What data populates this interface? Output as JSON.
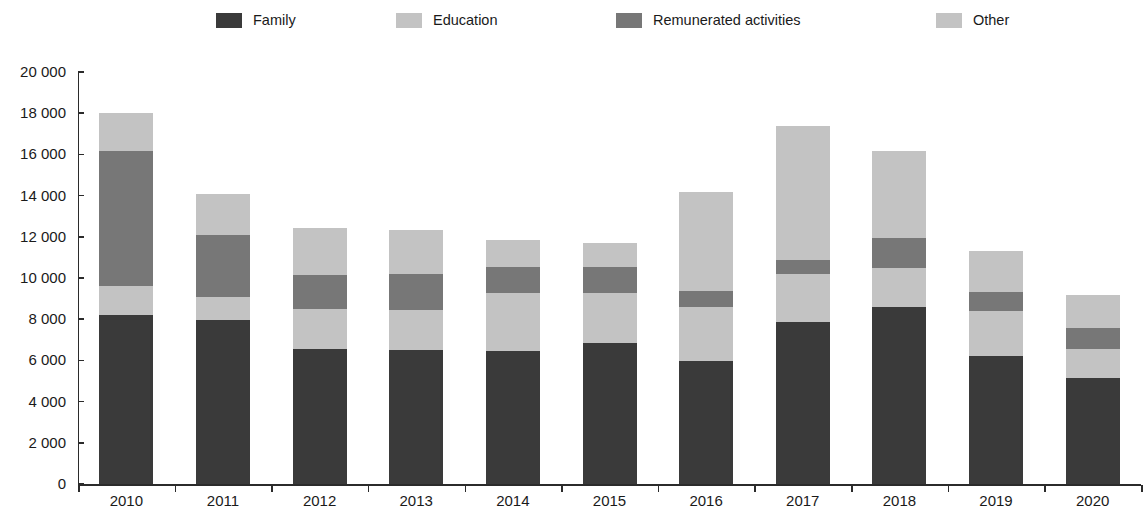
{
  "legend": {
    "items": [
      {
        "label": "Family",
        "color": "#3a3a3a",
        "x": 216
      },
      {
        "label": "Education",
        "color": "#c3c3c3",
        "x": 396
      },
      {
        "label": "Remunerated activities",
        "color": "#777777",
        "x": 616
      },
      {
        "label": "Other",
        "color": "#c3c3c3",
        "x": 936
      }
    ]
  },
  "axes": {
    "y_ticks": [
      "20 000",
      "18 000",
      "16 000",
      "14 000",
      "12 000",
      "10 000",
      "8 000",
      "6 000",
      "4 000",
      "2 000",
      "0"
    ],
    "y_tick_values": [
      20000,
      18000,
      16000,
      14000,
      12000,
      10000,
      8000,
      6000,
      4000,
      2000,
      0
    ],
    "y_min": 0,
    "y_max": 20000,
    "x_ticks": [
      "2010",
      "2011",
      "2012",
      "2013",
      "2014",
      "2015",
      "2016",
      "2017",
      "2018",
      "2019",
      "2020"
    ]
  },
  "chart_data": {
    "type": "bar",
    "stacked": true,
    "title": "",
    "subtitle": "",
    "xlabel": "",
    "ylabel": "",
    "ylim": [
      0,
      20000
    ],
    "grid": false,
    "legend_position": "top",
    "categories": [
      "2010",
      "2011",
      "2012",
      "2013",
      "2014",
      "2015",
      "2016",
      "2017",
      "2018",
      "2019",
      "2020"
    ],
    "series": [
      {
        "name": "Family",
        "color": "#3a3a3a",
        "values": [
          8200,
          7980,
          6530,
          6490,
          6450,
          6840,
          5980,
          7880,
          8600,
          6200,
          5150
        ]
      },
      {
        "name": "Education",
        "color": "#c3c3c3",
        "values": [
          1400,
          1120,
          1950,
          1980,
          2820,
          2430,
          2600,
          2300,
          1870,
          2180,
          1400
        ]
      },
      {
        "name": "Remunerated activities",
        "color": "#777777",
        "values": [
          6550,
          2980,
          1670,
          1740,
          1250,
          1260,
          790,
          700,
          1450,
          940,
          1040
        ]
      },
      {
        "name": "Other",
        "color": "#c3c3c3",
        "values": [
          1880,
          2020,
          2270,
          2110,
          1350,
          1180,
          4820,
          6520,
          4260,
          1990,
          1570
        ]
      }
    ],
    "totals": [
      18030,
      14100,
      12420,
      12320,
      11870,
      11710,
      14190,
      17400,
      16180,
      11310,
      9160
    ]
  },
  "colors": {
    "family": "#3a3a3a",
    "education": "#c3c3c3",
    "remunerated": "#777777",
    "other": "#c3c3c3",
    "axis": "#2b2b2b",
    "background": "#ffffff"
  }
}
